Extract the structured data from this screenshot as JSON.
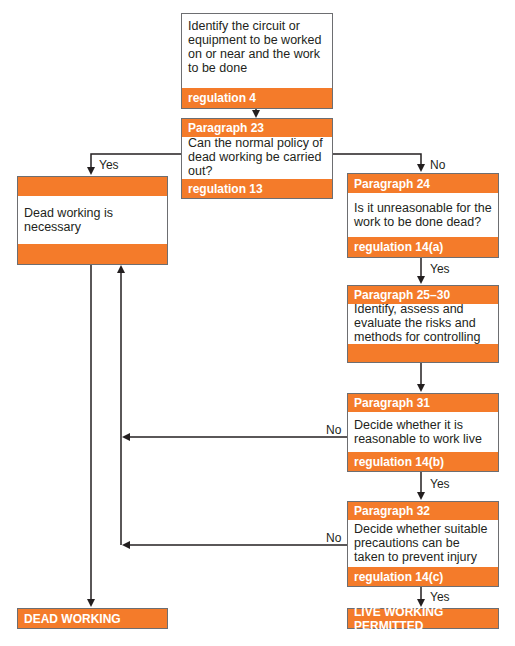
{
  "colors": {
    "accent": "#f47b2a",
    "line": "#231f20",
    "border": "#6d6e71"
  },
  "nodes": {
    "identify": {
      "body": "Identify the circuit or equipment to be worked on or near and the work to be done",
      "footer": "regulation 4"
    },
    "para23": {
      "header": "Paragraph 23",
      "body": "Can the normal policy of dead working be carried out?",
      "footer": "regulation 13"
    },
    "dead_necessary": {
      "header": "",
      "body": "Dead working is necessary",
      "footer": ""
    },
    "para24": {
      "header": "Paragraph 24",
      "body": "Is it unreasonable for the work to be done dead?",
      "footer": "regulation 14(a)"
    },
    "para25_30": {
      "header": "Paragraph 25–30",
      "body": "Identify, assess and evaluate the risks and methods for controlling",
      "footer": ""
    },
    "para31": {
      "header": "Paragraph 31",
      "body": "Decide whether it is reasonable to work live",
      "footer": "regulation 14(b)"
    },
    "para32": {
      "header": "Paragraph 32",
      "body": "Decide whether suitable precautions can be taken to prevent injury",
      "footer": "regulation 14(c)"
    },
    "dead_working": {
      "label": "DEAD WORKING"
    },
    "live_permitted": {
      "label": "LIVE WORKING PERMITTED"
    }
  },
  "edges": {
    "para23_yes": "Yes",
    "para23_no": "No",
    "para24_yes": "Yes",
    "para31_no": "No",
    "para31_yes": "Yes",
    "para32_no": "No",
    "para32_yes": "Yes"
  }
}
